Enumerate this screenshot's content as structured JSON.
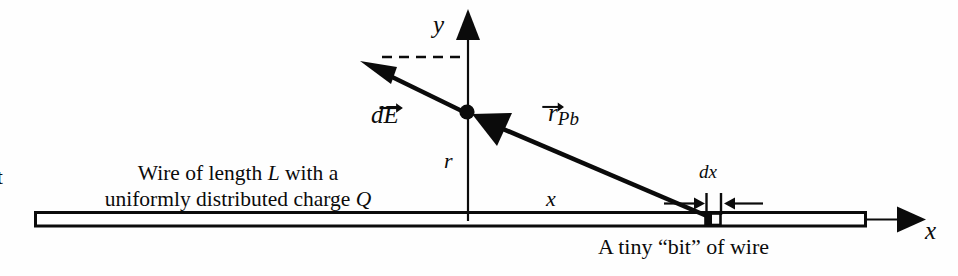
{
  "figure": {
    "width": 958,
    "height": 276,
    "background_color": "#fefefe",
    "ink_color": "#0b0b0b"
  },
  "axes": {
    "y_label": "y",
    "x_label": "x",
    "origin_note": "field point P on y-axis above the wire"
  },
  "labels": {
    "cut_off_left_text": "t",
    "field_vector": {
      "base": "d",
      "symbol": "E",
      "accent": "vector-arrow",
      "full": "dE⃗"
    },
    "position_vector": {
      "symbol": "r",
      "accent": "vector-arrow",
      "subscript": "Pb",
      "full": "r⃗_Pb"
    },
    "distance_r": "r",
    "distance_x": "x",
    "element_dx": "dx"
  },
  "wire": {
    "caption_line_1": "Wire of length L with a",
    "caption_line_2": "uniformly distributed charge Q",
    "length_symbol": "L",
    "charge_symbol": "Q"
  },
  "bit": {
    "caption": "A tiny “bit” of wire",
    "width_label": "dx"
  },
  "chart_data": {
    "type": "diagram",
    "elements": [
      {
        "name": "wire-rectangle",
        "kind": "rect",
        "x1": 35,
        "y1": 212,
        "x2": 866,
        "y2": 226
      },
      {
        "name": "x-axis-line",
        "kind": "line",
        "x1": 866,
        "y1": 219,
        "x2": 898,
        "y2": 219
      },
      {
        "name": "x-axis-arrowhead",
        "kind": "arrowhead",
        "x": 920,
        "y": 219,
        "direction": "right"
      },
      {
        "name": "y-axis-line",
        "kind": "line",
        "x1": 468,
        "y1": 219,
        "x2": 468,
        "y2": 30
      },
      {
        "name": "y-axis-arrowhead",
        "kind": "arrowhead",
        "x": 468,
        "y": 12,
        "direction": "up"
      },
      {
        "name": "field-point-dot",
        "kind": "dot",
        "x": 467,
        "y": 112,
        "r": 7
      },
      {
        "name": "dE-vector",
        "kind": "arrow",
        "x1": 467,
        "y1": 112,
        "x2": 362,
        "y2": 62
      },
      {
        "name": "dashed-horizontal",
        "kind": "dashed-line",
        "x1": 383,
        "y1": 57,
        "x2": 466,
        "y2": 57
      },
      {
        "name": "rPb-vector",
        "kind": "arrow",
        "x1": 712,
        "y1": 218,
        "x2": 474,
        "y2": 116
      },
      {
        "name": "charge-element",
        "kind": "rect-filled",
        "x1": 705,
        "y1": 213,
        "x2": 720,
        "y2": 225
      },
      {
        "name": "dx-left-arrow",
        "kind": "arrow",
        "x1": 663,
        "y1": 205,
        "x2": 702,
        "y2": 205
      },
      {
        "name": "dx-right-arrow",
        "kind": "arrow",
        "x1": 762,
        "y1": 205,
        "x2": 724,
        "y2": 205
      },
      {
        "name": "dx-left-tick",
        "kind": "tick",
        "x": 706,
        "y1": 194,
        "y2": 214
      },
      {
        "name": "dx-right-tick",
        "kind": "tick",
        "x": 720,
        "y1": 194,
        "y2": 214
      }
    ],
    "axis_ranges": {
      "x": [
        35,
        920
      ],
      "y": [
        12,
        226
      ]
    },
    "grid": false,
    "legend": null
  }
}
